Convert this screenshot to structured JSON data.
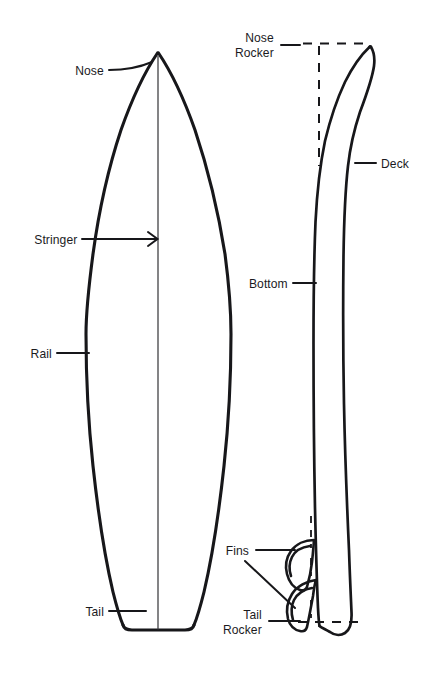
{
  "figure": {
    "kind": "surfboard-anatomy-diagram",
    "views": [
      {
        "name": "outline-view",
        "description": "top-down board outline with stringer"
      },
      {
        "name": "profile-view",
        "description": "side profile with rocker and fins"
      }
    ],
    "ink_color": "#17171a",
    "background_color": "#ffffff"
  },
  "labels": {
    "nose": "Nose",
    "stringer": "Stringer",
    "rail": "Rail",
    "tail": "Tail",
    "nose_rocker": "Nose\nRocker",
    "deck": "Deck",
    "bottom": "Bottom",
    "fins": "Fins",
    "tail_rocker": "Tail\nRocker"
  }
}
